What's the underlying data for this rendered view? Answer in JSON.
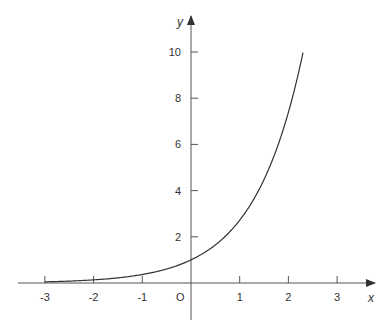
{
  "chart_data": {
    "type": "line",
    "title": "",
    "xlabel": "x",
    "ylabel": "y",
    "origin_label": "O",
    "function": "y = e^x",
    "xlim": [
      -3.3,
      3.6
    ],
    "ylim": [
      -1.5,
      10.5
    ],
    "x_ticks": [
      -3,
      -2,
      -1,
      1,
      2,
      3
    ],
    "x_tick_labels": [
      "-3",
      "-2",
      "-1",
      "1",
      "2",
      "3"
    ],
    "y_ticks": [
      2,
      4,
      6,
      8,
      10
    ],
    "y_tick_labels": [
      "2",
      "4",
      "6",
      "8",
      "10"
    ],
    "grid": false,
    "series": [
      {
        "name": "y = e^x",
        "x": [
          -3,
          -2.5,
          -2,
          -1.5,
          -1,
          -0.5,
          0,
          0.5,
          1,
          1.5,
          2,
          2.3
        ],
        "y": [
          0.05,
          0.08,
          0.14,
          0.22,
          0.37,
          0.61,
          1.0,
          1.65,
          2.72,
          4.48,
          7.39,
          10.0
        ]
      }
    ]
  }
}
